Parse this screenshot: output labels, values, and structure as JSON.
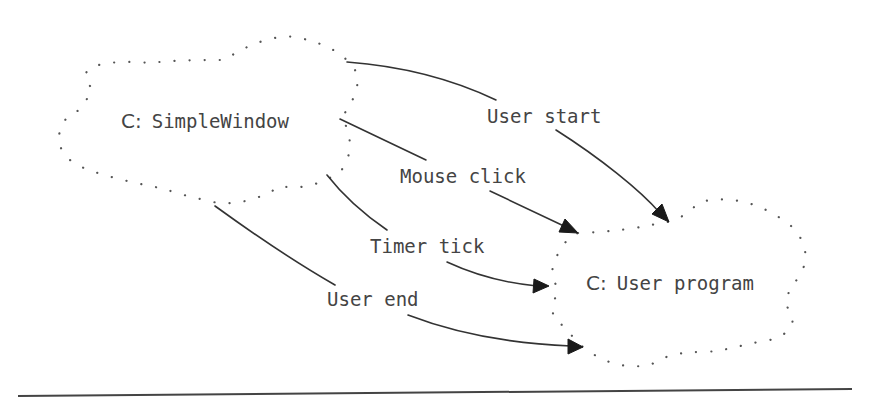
{
  "diagram": {
    "type": "class-interaction",
    "nodes": [
      {
        "id": "simple-window",
        "prefix": "C:",
        "name": "SimpleWindow"
      },
      {
        "id": "user-program",
        "prefix": "C:",
        "name": "User program"
      }
    ],
    "edges": [
      {
        "id": "user-start",
        "label": "User start",
        "from": "simple-window",
        "to": "user-program"
      },
      {
        "id": "mouse-click",
        "label": "Mouse click",
        "from": "simple-window",
        "to": "user-program"
      },
      {
        "id": "timer-tick",
        "label": "Timer tick",
        "from": "simple-window",
        "to": "user-program"
      },
      {
        "id": "user-end",
        "label": "User end",
        "from": "simple-window",
        "to": "user-program"
      }
    ]
  },
  "colors": {
    "background": "#ffffff",
    "text": "#444444",
    "line": "#333333",
    "cloud_dots": "#555555"
  }
}
